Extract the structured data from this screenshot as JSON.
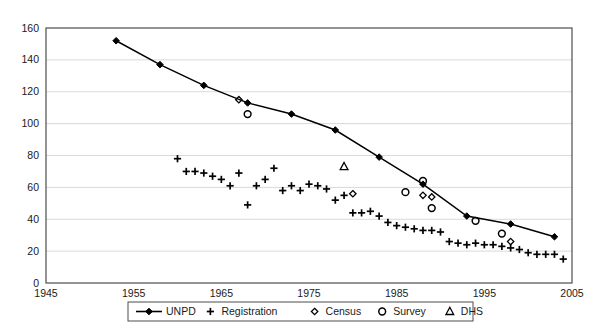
{
  "chart_data": {
    "type": "scatter",
    "title": "",
    "xlabel": "",
    "ylabel": "",
    "xlim": [
      1945,
      2005
    ],
    "ylim": [
      0,
      160
    ],
    "xticks": [
      1945,
      1955,
      1965,
      1975,
      1985,
      1995,
      2005
    ],
    "yticks": [
      0,
      20,
      40,
      60,
      80,
      100,
      120,
      140,
      160
    ],
    "grid": "horizontal",
    "legend_position": "bottom",
    "series": [
      {
        "name": "UNPD",
        "marker": "filled-diamond",
        "line": true,
        "points": [
          [
            1953,
            152
          ],
          [
            1958,
            137
          ],
          [
            1963,
            124
          ],
          [
            1968,
            113
          ],
          [
            1973,
            106
          ],
          [
            1978,
            96
          ],
          [
            1983,
            79
          ],
          [
            1988,
            62
          ],
          [
            1993,
            42
          ],
          [
            1998,
            37
          ],
          [
            2003,
            29
          ]
        ]
      },
      {
        "name": "Registration",
        "marker": "plus",
        "line": false,
        "points": [
          [
            1960,
            78
          ],
          [
            1961,
            70
          ],
          [
            1962,
            70
          ],
          [
            1963,
            69
          ],
          [
            1964,
            67
          ],
          [
            1965,
            65
          ],
          [
            1966,
            61
          ],
          [
            1967,
            69
          ],
          [
            1968,
            49
          ],
          [
            1969,
            61
          ],
          [
            1970,
            65
          ],
          [
            1971,
            72
          ],
          [
            1972,
            58
          ],
          [
            1973,
            61
          ],
          [
            1974,
            58
          ],
          [
            1975,
            62
          ],
          [
            1976,
            61
          ],
          [
            1977,
            59
          ],
          [
            1978,
            52
          ],
          [
            1979,
            55
          ],
          [
            1980,
            44
          ],
          [
            1981,
            44
          ],
          [
            1982,
            45
          ],
          [
            1983,
            42
          ],
          [
            1984,
            38
          ],
          [
            1985,
            36
          ],
          [
            1986,
            35
          ],
          [
            1987,
            34
          ],
          [
            1988,
            33
          ],
          [
            1989,
            33
          ],
          [
            1990,
            32
          ],
          [
            1991,
            26
          ],
          [
            1992,
            25
          ],
          [
            1993,
            24
          ],
          [
            1994,
            25
          ],
          [
            1995,
            24
          ],
          [
            1996,
            24
          ],
          [
            1997,
            23
          ],
          [
            1998,
            22
          ],
          [
            1999,
            21
          ],
          [
            2000,
            19
          ],
          [
            2001,
            18
          ],
          [
            2002,
            18
          ],
          [
            2003,
            18
          ],
          [
            2004,
            15
          ]
        ]
      },
      {
        "name": "Census",
        "marker": "open-diamond",
        "line": false,
        "points": [
          [
            1967,
            115
          ],
          [
            1980,
            56
          ],
          [
            1988,
            55
          ],
          [
            1989,
            54
          ],
          [
            1998,
            26
          ]
        ]
      },
      {
        "name": "Survey",
        "marker": "open-circle",
        "line": false,
        "points": [
          [
            1968,
            106
          ],
          [
            1986,
            57
          ],
          [
            1988,
            64
          ],
          [
            1989,
            47
          ],
          [
            1994,
            39
          ],
          [
            1997,
            31
          ]
        ]
      },
      {
        "name": "DHS",
        "marker": "open-triangle",
        "line": false,
        "points": [
          [
            1979,
            73
          ]
        ]
      }
    ]
  },
  "axis": {
    "x_labels": [
      "1945",
      "1955",
      "1965",
      "1975",
      "1985",
      "1995",
      "2005"
    ],
    "y_labels": [
      "0",
      "20",
      "40",
      "60",
      "80",
      "100",
      "120",
      "140",
      "160"
    ]
  },
  "legend": {
    "items": [
      {
        "label": "UNPD",
        "marker": "line-filled-diamond"
      },
      {
        "label": "Registration",
        "marker": "plus"
      },
      {
        "label": "Census",
        "marker": "open-diamond"
      },
      {
        "label": "Survey",
        "marker": "open-circle"
      },
      {
        "label": "DHS",
        "marker": "open-triangle"
      }
    ]
  },
  "colors": {
    "series": "#000000",
    "grid": "#d9d9d9",
    "border": "#4d4d4d",
    "text": "#1a1a1a",
    "background": "#ffffff"
  }
}
